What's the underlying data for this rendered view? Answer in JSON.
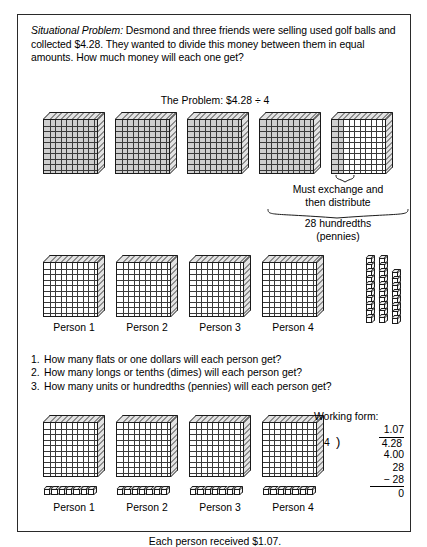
{
  "worksheet": {
    "statement_lead": "Situational Problem:",
    "statement_body": " Desmond and three friends were selling used golf balls and collected $4.28. They wanted to divide this money between them in equal amounts. How much money will each one get?",
    "problem_line": "The Problem: $4.28 ÷ 4",
    "footer": "Each person received $1.07."
  },
  "annotations": {
    "exchange_line1": "Must exchange and",
    "exchange_line2": "then distribute",
    "hundredths_line1": "28 hundredths",
    "hundredths_line2": "(pennies)"
  },
  "person_labels": [
    "Person 1",
    "Person 2",
    "Person 3",
    "Person 4"
  ],
  "questions": [
    {
      "num": "1.",
      "text": "How many flats or one dollars will each person get?"
    },
    {
      "num": "2.",
      "text": "How many longs or tenths (dimes) will each person get?"
    },
    {
      "num": "3.",
      "text": "How many units or hundredths (pennies) will each person get?"
    }
  ],
  "working_form": {
    "title": "Working form:",
    "quotient": "1.07",
    "divisor": "4",
    "bracket": ")",
    "dividend": "4.28",
    "step1": "4.00",
    "step2": "28",
    "step3": "− 28",
    "remainder": "0"
  },
  "manipulatives": {
    "row1_flats": 5,
    "row1_shaded_flats": 4,
    "row1_partial_shaded_columns": 2,
    "row2_flats": 4,
    "row2_unit_columns": [
      10,
      10,
      8
    ],
    "row3_flats": 4,
    "row3_units_per_person": 7,
    "flat_grid": 10
  },
  "colors": {
    "ink": "#1a1a1a",
    "border": "#2a2a2a",
    "shade": "#8c8c8c",
    "face3d": "#e3e3e3",
    "paper": "#ffffff"
  }
}
